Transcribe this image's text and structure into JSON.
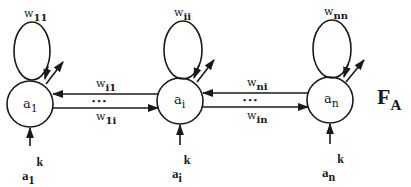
{
  "diagram": {
    "layer_label": {
      "main": "F",
      "sub": "A"
    },
    "nodes": [
      {
        "id": "a1",
        "label_main": "a",
        "label_sub": "1",
        "self_weight_main": "w",
        "self_weight_sub": "11",
        "input_main": "a",
        "input_sub": "1",
        "input_sup": "k"
      },
      {
        "id": "ai",
        "label_main": "a",
        "label_sub": "i",
        "self_weight_main": "w",
        "self_weight_sub": "ii",
        "input_main": "a",
        "input_sub": "i",
        "input_sup": "k"
      },
      {
        "id": "an",
        "label_main": "a",
        "label_sub": "n",
        "self_weight_main": "w",
        "self_weight_sub": "nn",
        "input_main": "a",
        "input_sub": "n",
        "input_sup": "k"
      }
    ],
    "edges": [
      {
        "from": "ai",
        "to": "a1",
        "label_main": "w",
        "label_sub": "i1"
      },
      {
        "from": "a1",
        "to": "ai",
        "label_main": "w",
        "label_sub": "1i"
      },
      {
        "from": "an",
        "to": "ai",
        "label_main": "w",
        "label_sub": "ni"
      },
      {
        "from": "ai",
        "to": "an",
        "label_main": "w",
        "label_sub": "in"
      }
    ],
    "ellipsis": "• • •"
  }
}
